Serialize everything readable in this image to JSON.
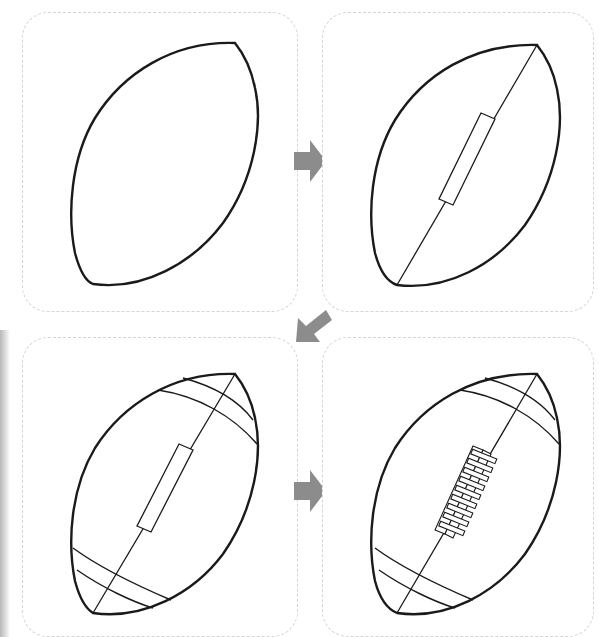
{
  "tutorial": {
    "subject": "american-football",
    "steps": [
      {
        "step": 1,
        "description": "Draw a pointed oval outline"
      },
      {
        "step": 2,
        "description": "Add diagonal center seam with lace rectangle"
      },
      {
        "step": 3,
        "description": "Add curved stripes near each end"
      },
      {
        "step": 4,
        "description": "Draw laces across the rectangle"
      }
    ],
    "arrows": [
      {
        "from": 1,
        "to": 2,
        "direction": "right"
      },
      {
        "from": 2,
        "to": 3,
        "direction": "down-left"
      },
      {
        "from": 3,
        "to": 4,
        "direction": "right"
      }
    ]
  },
  "colors": {
    "stroke": "#1a1a1a",
    "arrow": "#8c8c8c",
    "panel_border": "#d4d4d4",
    "background": "#ffffff"
  }
}
